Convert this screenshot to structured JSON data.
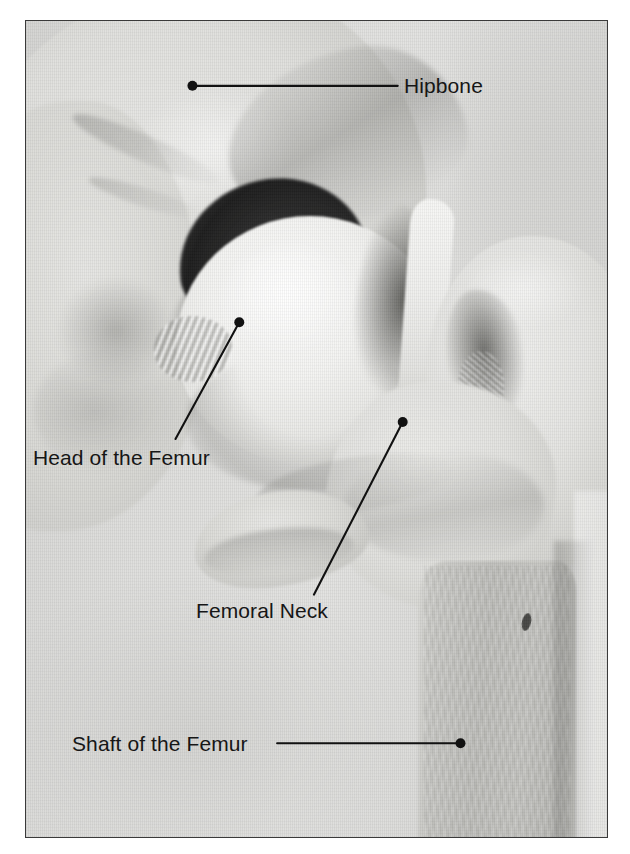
{
  "figure": {
    "type": "anatomical-photograph",
    "border_color": "#3a3a3a",
    "background_color": "#ffffff",
    "text_color": "#161616"
  },
  "labels": [
    {
      "id": "hipbone",
      "text": "Hipbone",
      "leader": {
        "dot_x": 193,
        "dot_y": 86,
        "line_to_x": 399,
        "line_to_y": 86
      }
    },
    {
      "id": "head-of-the-femur",
      "text": "Head of the Femur",
      "leader": {
        "dot_x": 240,
        "dot_y": 323,
        "line_to_x": 176,
        "line_to_y": 440
      }
    },
    {
      "id": "femoral-neck",
      "text": "Femoral Neck",
      "leader": {
        "dot_x": 404,
        "dot_y": 423,
        "line_to_x": 315,
        "line_to_y": 596
      }
    },
    {
      "id": "shaft-of-the-femur",
      "text": "Shaft of the Femur",
      "leader": {
        "dot_x": 462,
        "dot_y": 745,
        "line_to_x": 278,
        "line_to_y": 745
      }
    }
  ]
}
